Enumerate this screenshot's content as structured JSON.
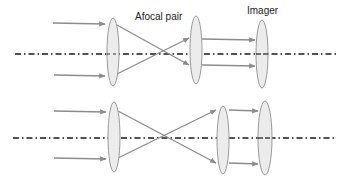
{
  "labels": {
    "afocal_pair": "Afocal pair",
    "imager": "Imager"
  },
  "colors": {
    "ray": "#8c8c8c",
    "lens_fill": "#ececec",
    "lens_stroke": "#9a9a9a",
    "axis": "#1a1a1a",
    "background": "#ffffff"
  },
  "diagrams": [
    {
      "name": "top-configuration",
      "axis_y": 54,
      "lenses": [
        {
          "name": "lens-1",
          "cx": 113,
          "cy": 52,
          "rx": 6,
          "ry": 34
        },
        {
          "name": "afocal-lens-2",
          "cx": 196,
          "cy": 50,
          "rx": 6,
          "ry": 34
        },
        {
          "name": "imager-lens",
          "cx": 262,
          "cy": 54,
          "rx": 6,
          "ry": 34
        }
      ]
    },
    {
      "name": "bottom-configuration",
      "axis_y": 138,
      "lenses": [
        {
          "name": "lens-1",
          "cx": 114,
          "cy": 137,
          "rx": 6,
          "ry": 35
        },
        {
          "name": "afocal-lens-2",
          "cx": 223,
          "cy": 140,
          "rx": 6,
          "ry": 34
        },
        {
          "name": "imager-lens",
          "cx": 265,
          "cy": 138,
          "rx": 7,
          "ry": 37
        }
      ]
    }
  ]
}
